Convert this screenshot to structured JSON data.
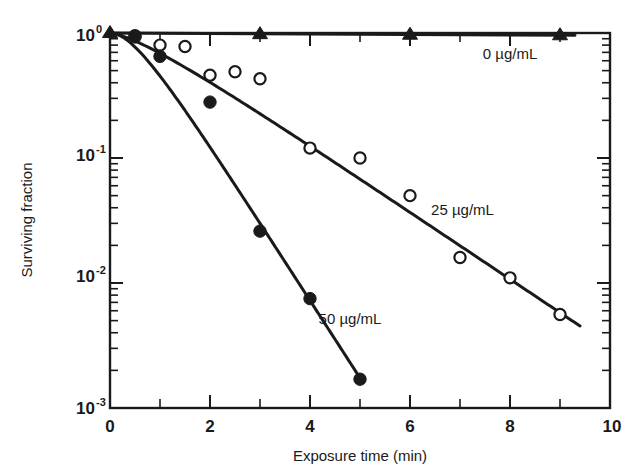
{
  "chart_data": {
    "type": "scatter",
    "title": "",
    "xlabel": "Exposure time (min)",
    "ylabel": "Surviving fraction",
    "xlim": [
      0,
      10
    ],
    "ylim": [
      0.001,
      1
    ],
    "yscale": "log",
    "xscale": "linear",
    "grid": false,
    "legend_position": "inline-annotations",
    "x_ticks": [
      "0",
      "2",
      "4",
      "6",
      "8",
      "10"
    ],
    "x_tick_values": [
      0,
      2,
      4,
      6,
      8,
      10
    ],
    "x_minor_tick_values": [
      1,
      3,
      5,
      7,
      9
    ],
    "y_ticks": [
      "10",
      "10",
      "10",
      "10"
    ],
    "y_tick_exponents": [
      "0",
      "-1",
      "-2",
      "-3"
    ],
    "y_tick_values": [
      1,
      0.1,
      0.01,
      0.001
    ],
    "series": [
      {
        "name": "0 µg/mL",
        "label": "0 µg/mL",
        "marker": "filled-triangle",
        "x": [
          0,
          3,
          6,
          9
        ],
        "values": [
          1.0,
          0.98,
          0.97,
          0.96
        ],
        "fit_x": [
          0,
          9.3
        ],
        "fit_values": [
          1.0,
          0.96
        ]
      },
      {
        "name": "25 µg/mL",
        "label": "25 µg/mL",
        "marker": "open-circle",
        "x": [
          0.5,
          1,
          1.5,
          2,
          2.5,
          3,
          4,
          5,
          6,
          7,
          8,
          9
        ],
        "values": [
          0.95,
          0.8,
          0.78,
          0.46,
          0.49,
          0.43,
          0.12,
          0.1,
          0.05,
          0.016,
          0.011,
          0.0056
        ],
        "fit_x": [
          0,
          9.4
        ],
        "fit_values": [
          1.0,
          0.0035
        ]
      },
      {
        "name": "50 µg/mL",
        "label": "50 µg/mL",
        "marker": "filled-circle",
        "x": [
          0.5,
          1,
          2,
          3,
          4,
          5
        ],
        "values": [
          0.93,
          0.65,
          0.28,
          0.026,
          0.0075,
          0.0017
        ],
        "fit_x": [
          0,
          5.05
        ],
        "fit_values": [
          1.0,
          0.00155
        ]
      }
    ],
    "annotations": [
      {
        "text": "0 µg/mL",
        "x": 8.0,
        "y": 0.62
      },
      {
        "text": "25 µg/mL",
        "x": 7.05,
        "y": 0.035
      },
      {
        "text": "50 µg/mL",
        "x": 4.8,
        "y": 0.0047
      }
    ],
    "colors": {
      "ink": "#1a1a1a",
      "background": "#ffffff",
      "marker_fill_open": "#ffffff"
    }
  }
}
